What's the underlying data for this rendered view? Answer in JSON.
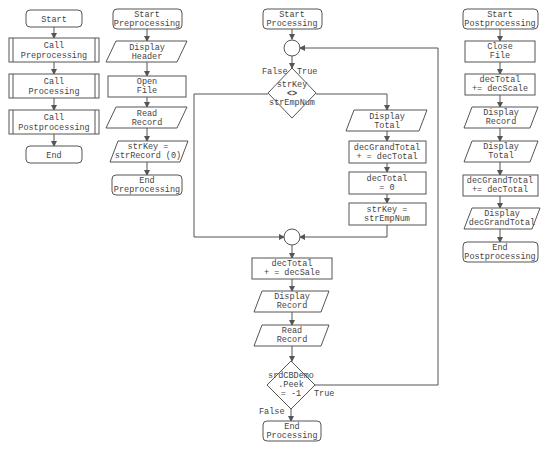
{
  "diagram": {
    "main": {
      "start": "Start",
      "call_pre": [
        "Call",
        "Preprocessing"
      ],
      "call_proc": [
        "Call",
        "Processing"
      ],
      "call_post": [
        "Call",
        "Postprocessing"
      ],
      "end": "End"
    },
    "preprocessing": {
      "start": [
        "Start",
        "Preprocessing"
      ],
      "display_header": [
        "Display",
        "Header"
      ],
      "open_file": [
        "Open",
        "File"
      ],
      "read_record": [
        "Read",
        "Record"
      ],
      "assign_key": [
        "strKey =",
        "strRecord (0)"
      ],
      "end": [
        "End",
        "Preprocessing"
      ]
    },
    "processing": {
      "start": [
        "Start",
        "Processing"
      ],
      "decision_key": [
        "strKey",
        "<>",
        "strEmpNum"
      ],
      "decision_key_false": "False",
      "decision_key_true": "True",
      "display_total": [
        "Display",
        "Total"
      ],
      "grand_total": [
        "decGrandTotal",
        "+ = decTotal"
      ],
      "reset_total": [
        "decTotal",
        "= 0"
      ],
      "assign_key": [
        "strKey =",
        "strEmpNum"
      ],
      "add_sale": [
        "decTotal",
        "+ = decSale"
      ],
      "display_record": [
        "Display",
        "Record"
      ],
      "read_record": [
        "Read",
        "Record"
      ],
      "decision_peek": [
        "srdCBDemo",
        ".Peek",
        "= -1"
      ],
      "decision_peek_true": "True",
      "decision_peek_false": "False",
      "end": [
        "End",
        "Processing"
      ]
    },
    "postprocessing": {
      "start": [
        "Start",
        "Postprocessing"
      ],
      "close_file": [
        "Close",
        "File"
      ],
      "add_scale": [
        "decTotal",
        "+= decScale"
      ],
      "display_record": [
        "Display",
        "Record"
      ],
      "display_total": [
        "Display",
        "Total"
      ],
      "grand_total": [
        "decGrandTotal",
        "+= decTotal"
      ],
      "display_grand": [
        "Display",
        "decGrandTotal"
      ],
      "end": [
        "End",
        "Postprocessing"
      ]
    }
  }
}
